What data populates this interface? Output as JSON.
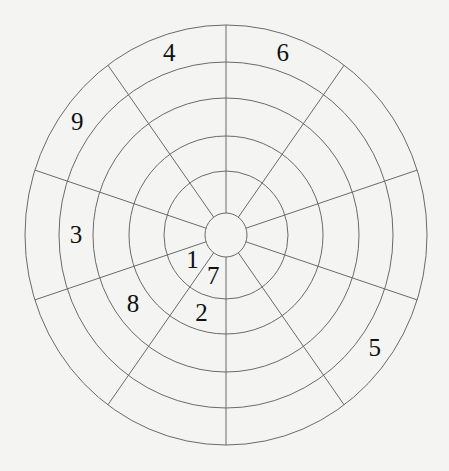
{
  "diagram": {
    "sectors": 10,
    "rings": 5,
    "line_color": "#6a6a6a",
    "background_color": "#f4f4f3",
    "text_color": "#111111",
    "numbers": [
      {
        "label": "4",
        "sector": 7,
        "ring": 5
      },
      {
        "label": "6",
        "sector": 8,
        "ring": 5
      },
      {
        "label": "9",
        "sector": 6,
        "ring": 5
      },
      {
        "label": "3",
        "sector": 5,
        "ring": 4
      },
      {
        "label": "1",
        "sector": 4,
        "ring": 1
      },
      {
        "label": "7",
        "sector": 3,
        "ring": 1
      },
      {
        "label": "8",
        "sector": 4,
        "ring": 3
      },
      {
        "label": "2",
        "sector": 3,
        "ring": 2
      },
      {
        "label": "5",
        "sector": 1,
        "ring": 5
      }
    ]
  }
}
